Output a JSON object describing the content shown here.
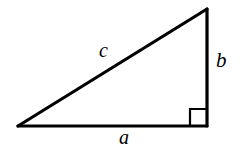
{
  "figure": {
    "name": "right-triangle-diagram",
    "type": "geometric-diagram",
    "background_color": "#ffffff",
    "stroke_color": "#000000",
    "stroke_width_px": 3
  },
  "labels": {
    "hypotenuse": "c",
    "vertical_leg": "b",
    "horizontal_leg": "a"
  },
  "geometry": {
    "vertices": {
      "left": [
        18,
        126
      ],
      "top_right": [
        207,
        9
      ],
      "bottom_right": [
        207,
        126
      ]
    },
    "right_angle_marker": {
      "corner": [
        207,
        126
      ],
      "size_px": 17,
      "inner_corner": [
        190,
        109
      ]
    },
    "label_positions": {
      "hypotenuse": [
        107,
        51
      ],
      "vertical_leg": [
        222,
        62
      ],
      "horizontal_leg": [
        127,
        138
      ]
    }
  }
}
